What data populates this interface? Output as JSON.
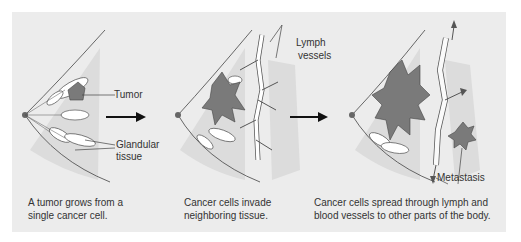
{
  "panels": [
    {
      "labels": {
        "tumor": "Tumor",
        "glandular": "Glandular",
        "tissue": "tissue"
      },
      "caption": {
        "line1": "A tumor grows from a",
        "line2": "single cancer cell."
      }
    },
    {
      "labels": {
        "lymph": "Lymph",
        "vessels": "vessels"
      },
      "caption": {
        "line1": "Cancer cells invade",
        "line2": "neighboring tissue."
      }
    },
    {
      "labels": {
        "metastasis": "Metastasis"
      },
      "caption": {
        "line1": "Cancer cells spread through lymph and",
        "line2": "blood vessels to other parts of the body."
      }
    }
  ],
  "colors": {
    "background": "#ececec",
    "tissue_shade": "#dcdcdc",
    "tumor": "#7a7a7a",
    "line": "#444444"
  }
}
